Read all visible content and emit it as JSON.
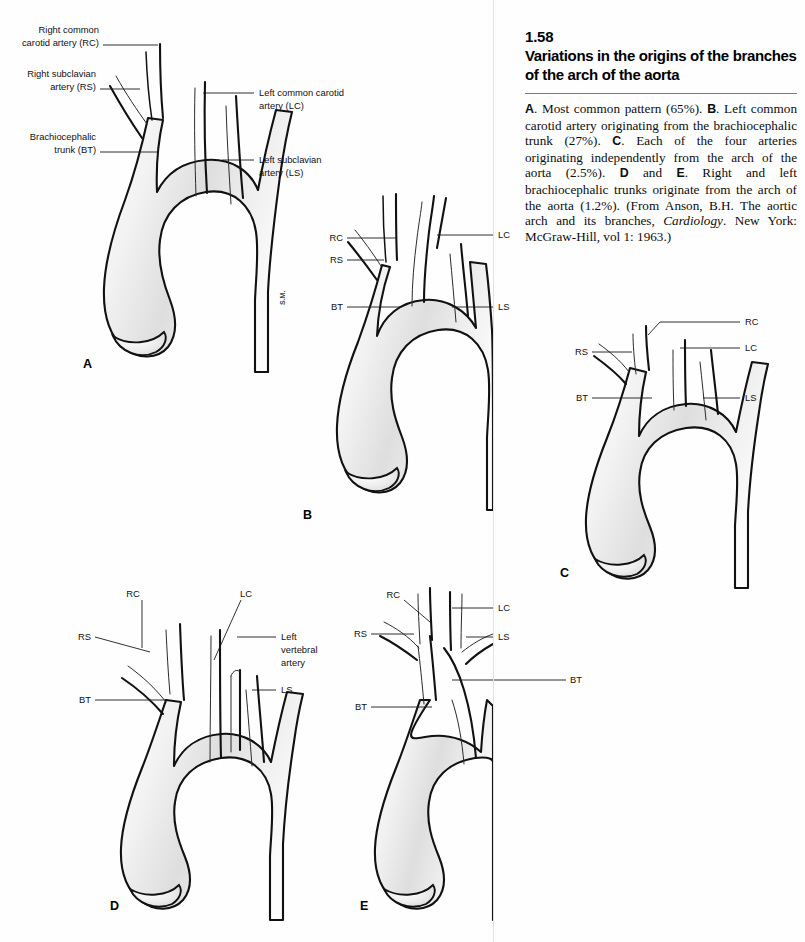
{
  "document": {
    "figure_number": "1.58",
    "figure_title": "Variations in the origins of the branches of the arch of the aorta",
    "artist_signature": "S.M."
  },
  "caption": {
    "segments": [
      {
        "bold": "A",
        "text": ". Most common pattern (65%). "
      },
      {
        "bold": "B",
        "text": ". Left common carotid artery originating from the brachiocephalic trunk (27%). "
      },
      {
        "bold": "C",
        "text": ". Each of the four arteries originating independently from the arch of the aorta (2.5%). "
      },
      {
        "bold": "D",
        "text": " and "
      },
      {
        "bold": "E",
        "text": ". Right and left brachiocephalic trunks originate from the arch of the aorta (1.2%). (From Anson, B.H. The aortic arch and its branches, "
      },
      {
        "italic": "Cardiology",
        "text": ". New York: McGraw-Hill, vol 1: 1963.)"
      }
    ],
    "plain_text": "A. Most common pattern (65%). B. Left common carotid artery originating from the brachiocephalic trunk (27%). C. Each of the four arteries originating independently from the arch of the aorta (2.5%). D and E. Right and left brachiocephalic trunks originate from the arch of the aorta (1.2%). (From Anson, B.H. The aortic arch and its branches, Cardiology. New York: McGraw-Hill, vol 1: 1963.)"
  },
  "panels": [
    {
      "id": "A",
      "letter": "A",
      "description": "Most common pattern (65%)",
      "labels": [
        {
          "key": "RC",
          "text_line1": "Right common",
          "text_line2": "carotid artery (RC)",
          "side": "left"
        },
        {
          "key": "RS",
          "text_line1": "Right subclavian",
          "text_line2": "artery (RS)",
          "side": "left"
        },
        {
          "key": "BT",
          "text_line1": "Brachiocephalic",
          "text_line2": "trunk (BT)",
          "side": "left"
        },
        {
          "key": "LC",
          "text_line1": "Left common carotid",
          "text_line2": "artery (LC)",
          "side": "right"
        },
        {
          "key": "LS",
          "text_line1": "Left subclavian",
          "text_line2": "artery (LS)",
          "side": "right"
        }
      ]
    },
    {
      "id": "B",
      "letter": "B",
      "description": "Left common carotid artery originating from the brachiocephalic trunk (27%)",
      "labels": [
        {
          "key": "RC",
          "text_line1": "RC",
          "side": "left"
        },
        {
          "key": "RS",
          "text_line1": "RS",
          "side": "left"
        },
        {
          "key": "BT",
          "text_line1": "BT",
          "side": "left"
        },
        {
          "key": "LC",
          "text_line1": "LC",
          "side": "right"
        },
        {
          "key": "LS",
          "text_line1": "LS",
          "side": "right"
        }
      ]
    },
    {
      "id": "C",
      "letter": "C",
      "description": "Each of the four arteries originating independently from the arch of the aorta (2.5%)",
      "labels": [
        {
          "key": "RC",
          "text_line1": "RC",
          "side": "right"
        },
        {
          "key": "RS",
          "text_line1": "RS",
          "side": "left"
        },
        {
          "key": "BT",
          "text_line1": "BT",
          "side": "left"
        },
        {
          "key": "LC",
          "text_line1": "LC",
          "side": "right"
        },
        {
          "key": "LS",
          "text_line1": "LS",
          "side": "right"
        }
      ]
    },
    {
      "id": "D",
      "letter": "D",
      "description": "Right and left brachiocephalic trunks originate from the arch of the aorta (1.2%)",
      "labels": [
        {
          "key": "RC",
          "text_line1": "RC",
          "side": "top"
        },
        {
          "key": "RS",
          "text_line1": "RS",
          "side": "left"
        },
        {
          "key": "BT",
          "text_line1": "BT",
          "side": "left"
        },
        {
          "key": "LC",
          "text_line1": "LC",
          "side": "top"
        },
        {
          "key": "LV",
          "text_line1": "Left",
          "text_line2": "vertebral",
          "text_line3": "artery",
          "side": "right"
        },
        {
          "key": "LS",
          "text_line1": "LS",
          "side": "right"
        }
      ]
    },
    {
      "id": "E",
      "letter": "E",
      "description": "Right and left brachiocephalic trunks originate from the arch of the aorta (1.2%)",
      "labels": [
        {
          "key": "RC",
          "text_line1": "RC",
          "side": "top"
        },
        {
          "key": "RS",
          "text_line1": "RS",
          "side": "left"
        },
        {
          "key": "BT_left",
          "text_line1": "BT",
          "side": "left"
        },
        {
          "key": "LC",
          "text_line1": "LC",
          "side": "right"
        },
        {
          "key": "LS",
          "text_line1": "LS",
          "side": "right"
        },
        {
          "key": "BT_right",
          "text_line1": "BT",
          "side": "right"
        }
      ]
    }
  ],
  "colors": {
    "background": "#ffffff",
    "ink": "#111111",
    "vessel_fill_light": "#fbfbfb",
    "vessel_fill_shade": "#d8d8d8",
    "rule": "#7a7a7a"
  }
}
